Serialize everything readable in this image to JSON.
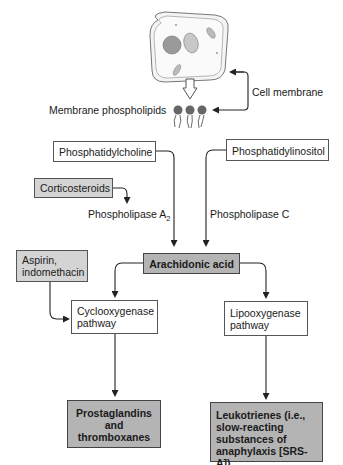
{
  "diagram": {
    "labels": {
      "cell_membrane": "Cell membrane",
      "membrane_phospholipids": "Membrane phospholipids",
      "phospholipase_a2": "Phospholipase A",
      "phospholipase_a2_sub": "2",
      "phospholipase_c": "Phospholipase C"
    },
    "boxes": {
      "phosphatidylcholine": "Phosphatidylcholine",
      "phosphatidylinositol": "Phosphatidylinositol",
      "corticosteroids": "Corticosteroids",
      "aspirin_line1": "Aspirin,",
      "aspirin_line2": "indomethacin",
      "arachidonic_acid": "Arachidonic acid",
      "cyclooxygenase_line1": "Cyclooxygenase",
      "cyclooxygenase_line2": "pathway",
      "lipooxygenase_line1": "Lipooxygenase",
      "lipooxygenase_line2": "pathway",
      "prostaglandins_line1": "Prostaglandins",
      "prostaglandins_line2": "and",
      "prostaglandins_line3": "thromboxanes",
      "leukotrienes_line1": "Leukotrienes (i.e.,",
      "leukotrienes_line2": "slow-reacting",
      "leukotrienes_line3": "substances of",
      "leukotrienes_line4": "anaphylaxis [SRS-A])"
    },
    "colors": {
      "line": "#222222",
      "grey_box": "#d4d4d4",
      "dark_box": "#b4b4b4"
    }
  }
}
